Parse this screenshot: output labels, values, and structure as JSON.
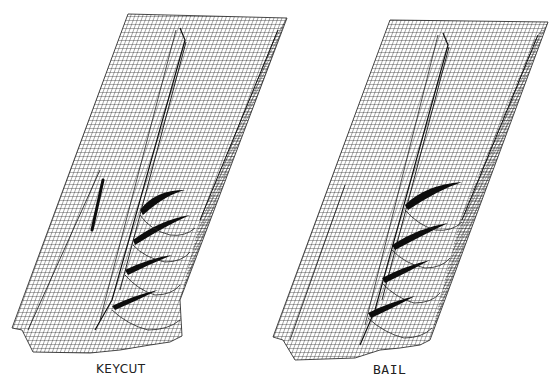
{
  "figure": {
    "panels": [
      {
        "id": "left",
        "caption": "KEYCUT",
        "features": [
          "longitudinal groove",
          "narrow key slot",
          "four curved ridges"
        ]
      },
      {
        "id": "right",
        "caption": "BAIL",
        "features": [
          "longitudinal groove",
          "four curved ridges"
        ]
      }
    ],
    "colors": {
      "background": "#ffffff",
      "mesh": "#1a1a1a",
      "shadow": "#0d0d0d"
    }
  }
}
